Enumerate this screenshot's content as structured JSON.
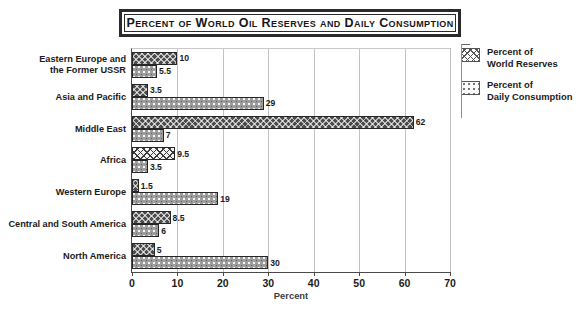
{
  "chart_data": {
    "type": "bar",
    "orientation": "horizontal",
    "title": "Percent of World Oil Reserves and Daily Consumption",
    "xlabel": "Percent",
    "ylabel": "",
    "xlim": [
      0,
      70
    ],
    "xticks": [
      0,
      10,
      20,
      30,
      40,
      50,
      60,
      70
    ],
    "grid": true,
    "legend_position": "right",
    "categories": [
      "Eastern Europe and\nthe Former USSR",
      "Asia and Pacific",
      "Middle East",
      "Africa",
      "Western Europe",
      "Central and South America",
      "North America"
    ],
    "series": [
      {
        "name": "Percent of\nWorld Reserves",
        "values": [
          10,
          3.5,
          62,
          9.5,
          1.5,
          8.5,
          5
        ],
        "labels": [
          "10",
          "3.5",
          "62",
          "9.5",
          "1.5",
          "8.5",
          "5"
        ]
      },
      {
        "name": "Percent of\nDaily Consumption",
        "values": [
          5.5,
          29,
          7,
          3.5,
          19,
          6,
          30
        ],
        "labels": [
          "5.5",
          "29",
          "7",
          "3.5",
          "19",
          "6",
          "30"
        ]
      }
    ]
  },
  "legend": {
    "entries": [
      {
        "label": "Percent of\nWorld Reserves"
      },
      {
        "label": "Percent of\nDaily Consumption"
      }
    ]
  }
}
